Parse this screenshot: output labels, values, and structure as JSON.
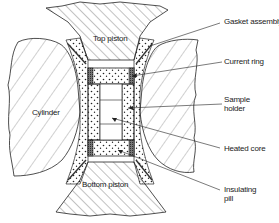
{
  "diagram": {
    "type": "cross-section schematic",
    "components": {
      "top_piston": "Top piston",
      "cylinder": "Cylinder",
      "bottom_piston": "Bottom piston"
    },
    "callouts": [
      {
        "id": "gasket",
        "label": "Gasket assembly"
      },
      {
        "id": "current-ring",
        "label": "Current ring"
      },
      {
        "id": "sample-holder",
        "line1": "Sample",
        "line2": "holder"
      },
      {
        "id": "heated-core",
        "label": "Heated core"
      },
      {
        "id": "insulating-pill",
        "line1": "Insulating",
        "line2": "pill"
      }
    ],
    "colors": {
      "line": "#222222",
      "background": "#ffffff",
      "ring_fill": "#555555"
    }
  }
}
